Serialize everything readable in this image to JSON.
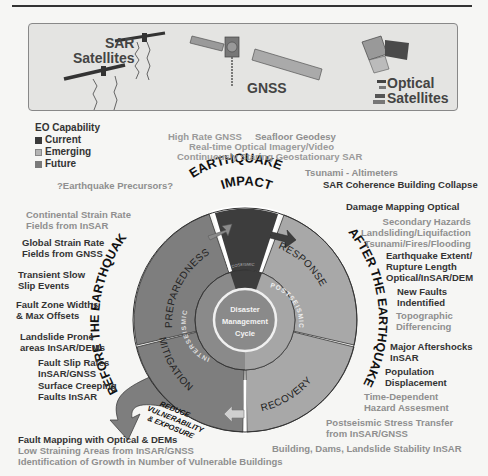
{
  "satellites": {
    "sar_label": "SAR\nSatellites",
    "sar_line1": "SAR",
    "sar_line2": "Satellites",
    "gnss_label": "GNSS",
    "optical_line1": "Optical",
    "optical_line2": "Satellites"
  },
  "legend": {
    "title": "EO Capability",
    "items": [
      {
        "label": "Current",
        "color": "#3a3a3a"
      },
      {
        "label": "Emerging",
        "color": "#aaaaaa"
      },
      {
        "label": "Future",
        "color": "#7a7a7a"
      }
    ]
  },
  "cycle": {
    "center_line1": "Disaster",
    "center_line2": "Management",
    "center_line3": "Cycle",
    "inner_left": "INTERSEISMIC",
    "inner_right": "POSTSEISMIC",
    "inner_top": "COSEISMIC",
    "segments": {
      "impact": "EARTHQUAKE IMPACT",
      "impact_line1": "EARTHQUAKE",
      "impact_line2": "IMPACT",
      "preparedness": "PREPAREDNESS",
      "response": "RESPONSE",
      "recovery": "RECOVERY",
      "mitigation": "MITIGATION"
    },
    "before": "BEFORE THE EARTHQUAKE",
    "after": "AFTER THE EARTHQUAKE",
    "reduce_line1": "REDUCE",
    "reduce_line2": "VULNERABILITY",
    "reduce_line3": "& EXPOSURE",
    "colors": {
      "impact": "#3d3d3d",
      "preparedness": "#7e7e7e",
      "mitigation": "#7e7e7e",
      "response": "#a8a8a8",
      "recovery": "#a8a8a8"
    }
  },
  "top_capabilities": [
    {
      "text": "High Rate GNSS",
      "level": "future"
    },
    {
      "text": "Seafloor Geodesy",
      "level": "emerging"
    },
    {
      "text": "Real-time Optical Imagery/Video",
      "level": "future"
    },
    {
      "text": "Continuously Staring Geostationary SAR",
      "level": "future"
    },
    {
      "text": "Tsunami - Altimeters",
      "level": "emerging"
    },
    {
      "text": "SAR Coherence Building Collapse",
      "level": "current"
    },
    {
      "text": "?Earthquake Precursors?",
      "level": "emerging"
    }
  ],
  "left_capabilities": [
    {
      "text": "Continental Strain Rate\nFields from InSAR",
      "l1": "Continental Strain Rate",
      "l2": "Fields from InSAR",
      "level": "emerging"
    },
    {
      "text": "Global Strain Rate\nFields from GNSS",
      "l1": "Global Strain Rate",
      "l2": "Fields from GNSS",
      "level": "current"
    },
    {
      "l1": "Transient Slow",
      "l2": "Slip Events",
      "level": "current"
    },
    {
      "l1": "Fault Zone Widths",
      "l2": "& Max Offsets",
      "level": "current"
    },
    {
      "l1": "Landslide Prone",
      "l2": "areas InSAR/DEMs",
      "level": "current"
    },
    {
      "l1": "Fault Slip Rates",
      "l2": "InSAR/GNSS",
      "level": "current"
    },
    {
      "l1": "Surface Creeping",
      "l2": "Faults InSAR",
      "level": "current"
    }
  ],
  "right_capabilities": [
    {
      "l1": "Damage Mapping Optical",
      "level": "current"
    },
    {
      "l1": "Secondary Hazards",
      "l2": "Landsliding/Liquifaction",
      "l3": "Tsunami/Fires/Flooding",
      "level": "emerging"
    },
    {
      "l1": "Earthquake Extent/",
      "l2": "Rupture Length",
      "l3": "Optical/InSAR/DEM",
      "level": "current"
    },
    {
      "l1": "New Faults",
      "l2": "Indentified",
      "level": "current"
    },
    {
      "l1": "Topographic",
      "l2": "Differencing",
      "level": "emerging"
    },
    {
      "l1": "Major Aftershocks",
      "l2": "InSAR",
      "level": "current"
    },
    {
      "l1": "Population",
      "l2": "Displacement",
      "level": "current"
    },
    {
      "l1": "Time-Dependent",
      "l2": "Hazard Assesment",
      "level": "emerging"
    },
    {
      "l1": "Postseismic Stress Transfer",
      "l2": "from InSAR/GNSS",
      "level": "emerging"
    },
    {
      "l1": "Building, Dams, Landslide Stability InSAR",
      "level": "emerging"
    }
  ],
  "bottom_capabilities": [
    {
      "text": "Fault Mapping with Optical & DEMs",
      "level": "current"
    },
    {
      "text": "Low Straining Areas from InSAR/GNSS",
      "level": "emerging"
    },
    {
      "text": "Identification of Growth in Number of Vulnerable Buildings",
      "level": "emerging"
    }
  ]
}
